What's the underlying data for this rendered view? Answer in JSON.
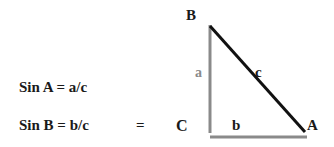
{
  "formulas": {
    "sin_a": "Sin A = a/c",
    "sin_b": "Sin B = b/c",
    "equals": "="
  },
  "triangle": {
    "vertices": {
      "B": "B",
      "C": "C",
      "A": "A"
    },
    "sides": {
      "a": "a",
      "b": "b",
      "c": "c"
    },
    "colors": {
      "legs": "#8a8a8a",
      "hypotenuse": "#111111",
      "side_a_label": "#8a8a8a"
    }
  }
}
